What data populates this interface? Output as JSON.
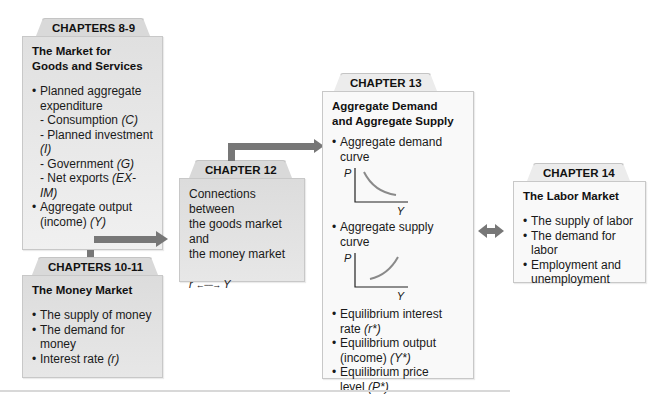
{
  "diagram": {
    "box_goods": {
      "tab": "CHAPTERS 8-9",
      "title_line1": "The Market for",
      "title_line2": "Goods and Services",
      "items": [
        {
          "text": "Planned aggregate",
          "continuation": "expenditure"
        },
        {
          "sub": "- Consumption ",
          "var": "(C)"
        },
        {
          "sub": "- Planned investment ",
          "var": "(I)"
        },
        {
          "sub": "- Government ",
          "var": "(G)"
        },
        {
          "sub": "- Net exports ",
          "var": "(EX-IM)"
        },
        {
          "text": "Aggregate output",
          "continuation": "(income) ",
          "var": "(Y)"
        }
      ]
    },
    "box_money": {
      "tab": "CHAPTERS 10-11",
      "title": "The Money Market",
      "items": [
        {
          "text": "The supply of money"
        },
        {
          "text": "The demand for money"
        },
        {
          "text": "Interest rate ",
          "var": "(r)"
        }
      ]
    },
    "box_connections": {
      "tab": "CHAPTER 12",
      "line1": "Connections between",
      "line2": "the goods market and",
      "line3": "the money market",
      "relation_left": "r",
      "relation_arrow": "←−−→",
      "relation_right": "Y"
    },
    "box_adas": {
      "tab": "CHAPTER 13",
      "title_line1": "Aggregate Demand",
      "title_line2": "and Aggregate Supply",
      "items": [
        {
          "text": "Aggregate demand curve",
          "graph": {
            "y_label": "P",
            "x_label": "Y",
            "shape": "downward-sloping"
          }
        },
        {
          "text": "Aggregate supply curve",
          "graph": {
            "y_label": "P",
            "x_label": "Y",
            "shape": "upward-sloping"
          }
        },
        {
          "text": "Equilibrium interest",
          "continuation": "rate ",
          "var": "(r*)"
        },
        {
          "text": "Equilibrium output",
          "continuation": "(income) ",
          "var": "(Y*)"
        },
        {
          "text": "Equilibrium price",
          "continuation": "level ",
          "var": "(P*)"
        }
      ]
    },
    "box_labor": {
      "tab": "CHAPTER 14",
      "title": "The Labor Market",
      "items": [
        {
          "text": "The supply of labor"
        },
        {
          "text": "The demand for labor"
        },
        {
          "text": "Employment and",
          "continuation": "unemployment"
        }
      ]
    },
    "colors": {
      "arrow": "#777777",
      "box_gray": "#e3e3e3",
      "box_white": "#f9f9f9",
      "tab_gray": "#d9d9d9",
      "curve": "#8a8a8a"
    }
  }
}
